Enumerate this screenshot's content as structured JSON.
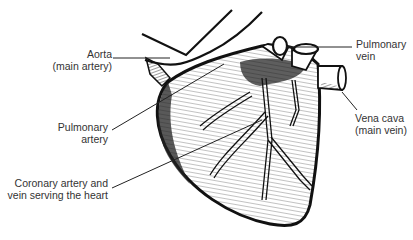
{
  "diagram": {
    "subject": "heart",
    "labels": [
      {
        "id": "aorta",
        "line1": "Aorta",
        "line2": "(main artery)"
      },
      {
        "id": "pulmonary-artery",
        "line1": "Pulmonary",
        "line2": "artery"
      },
      {
        "id": "coronary",
        "line1": "Coronary artery and",
        "line2": "vein serving the heart"
      },
      {
        "id": "pulmonary-vein",
        "line1": "Pulmonary",
        "line2": "vein"
      },
      {
        "id": "vena-cava",
        "line1": "Vena cava",
        "line2": "(main vein)"
      }
    ],
    "colors": {
      "ink": "#111111",
      "label": "#333333",
      "background": "#ffffff"
    }
  }
}
